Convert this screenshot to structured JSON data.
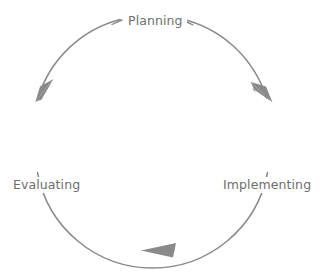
{
  "diagram": {
    "type": "cycle",
    "title": "",
    "direction": "clockwise",
    "stroke_color": "#8a8a8a",
    "label_color": "#6e6e6e",
    "background_color": "#ffffff",
    "circle": {
      "cx": 152,
      "cy": 135,
      "r": 117,
      "stroke_width": 1.5
    },
    "nodes": [
      {
        "id": "planning",
        "label": "Planning",
        "position": "top",
        "angle_deg": 270
      },
      {
        "id": "implementing",
        "label": "Implementing",
        "position": "right",
        "angle_deg": 0
      },
      {
        "id": "evaluating",
        "label": "Evaluating",
        "position": "left",
        "angle_deg": 180
      }
    ],
    "arrows": [
      {
        "id": "planning-to-implementing",
        "name": "arrowhead-right",
        "angle_deg": 315,
        "points": "clockwise-down-right"
      },
      {
        "id": "implementing-to-evaluating",
        "name": "arrowhead-bottom",
        "angle_deg": 87,
        "points": "left"
      },
      {
        "id": "evaluating-to-planning",
        "name": "arrowhead-left",
        "angle_deg": 205,
        "points": "up-right"
      }
    ]
  }
}
